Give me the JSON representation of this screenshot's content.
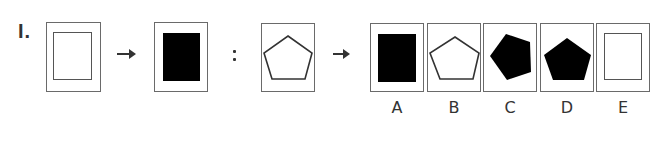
{
  "question": {
    "number": "I.",
    "stem": [
      {
        "id": "stem-1",
        "shape": "rectangle-outline-in-frame"
      },
      {
        "id": "stem-2",
        "shape": "rectangle-filled"
      },
      {
        "id": "stem-3",
        "shape": "pentagon-outline"
      }
    ],
    "symbols": {
      "arrow": "→",
      "colon": ":"
    },
    "options": [
      {
        "label": "A",
        "shape": "rectangle-filled"
      },
      {
        "label": "B",
        "shape": "pentagon-outline"
      },
      {
        "label": "C",
        "shape": "pentagon-filled-rotated"
      },
      {
        "label": "D",
        "shape": "pentagon-filled"
      },
      {
        "label": "E",
        "shape": "rectangle-outline"
      }
    ]
  },
  "colors": {
    "frame": "#6a6a6a",
    "fill": "#000000",
    "text": "#333333"
  }
}
